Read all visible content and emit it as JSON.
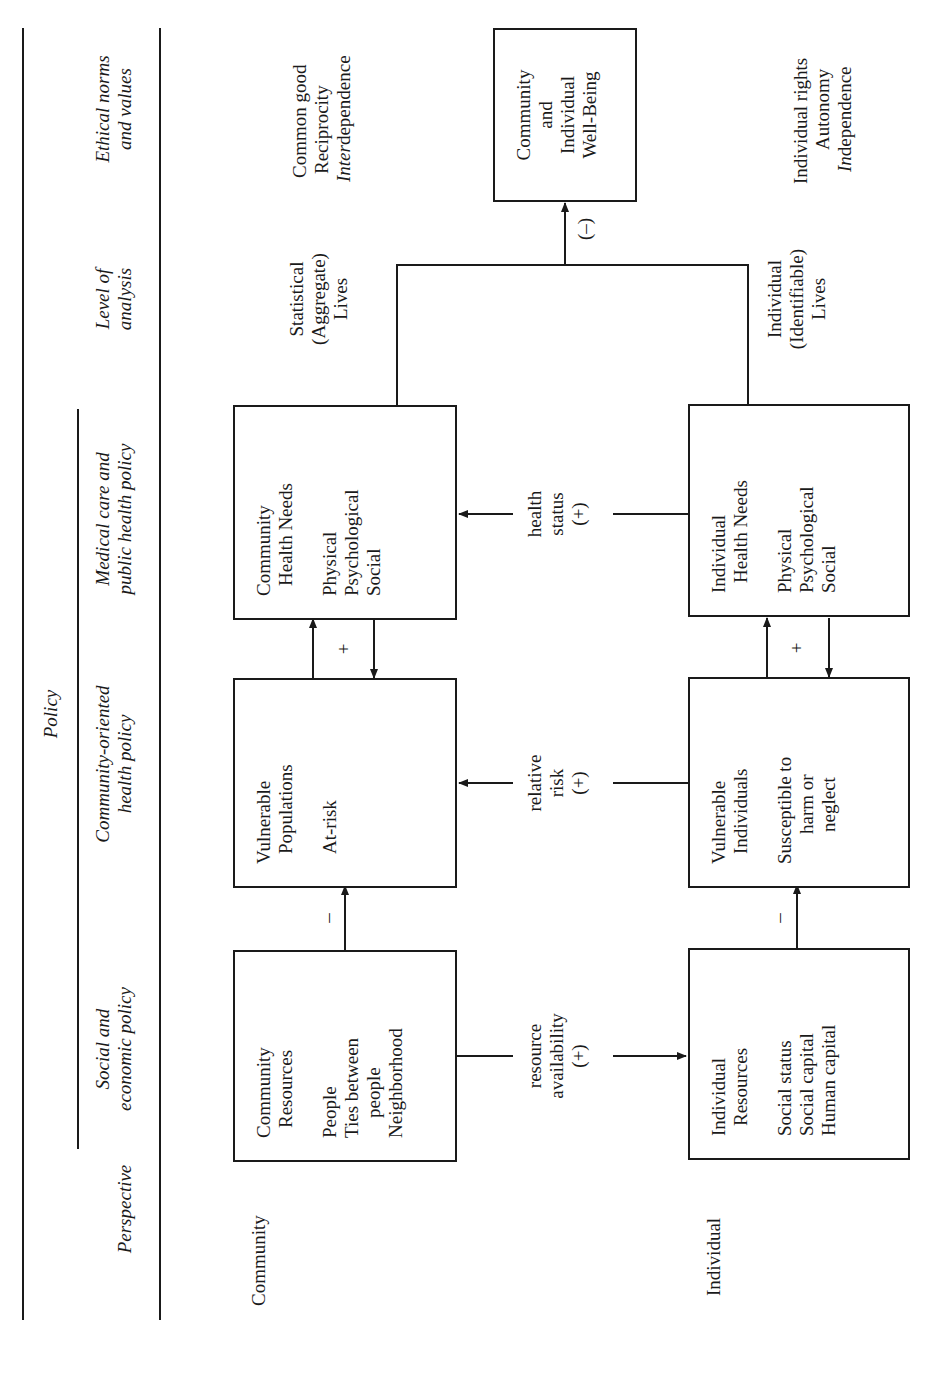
{
  "header": {
    "policy_title": "Policy",
    "columns": [
      {
        "key": "perspective",
        "label_line1": "Perspective",
        "label_line2": ""
      },
      {
        "key": "social_economic",
        "label_line1": "Social and",
        "label_line2": "economic policy"
      },
      {
        "key": "community_oriented",
        "label_line1": "Community-oriented",
        "label_line2": "health policy"
      },
      {
        "key": "medical_public",
        "label_line1": "Medical care and",
        "label_line2": "public health policy"
      },
      {
        "key": "level_analysis",
        "label_line1": "Level of",
        "label_line2": "analysis"
      },
      {
        "key": "ethical",
        "label_line1": "Ethical norms",
        "label_line2": "and values"
      }
    ]
  },
  "rows": {
    "community": {
      "perspective": "Community",
      "resources": {
        "title1": "Community",
        "title2": "Resources",
        "items": [
          "People",
          "Ties between",
          "people",
          "Neighborhood"
        ]
      },
      "vulnerable": {
        "title1": "Vulnerable",
        "title2": "Populations",
        "items": [
          "At-risk"
        ]
      },
      "health_needs": {
        "title1": "Community",
        "title2": "Health Needs",
        "items": [
          "Physical",
          "Psychological",
          "Social"
        ]
      },
      "level": [
        "Statistical",
        "(Aggregate)",
        "Lives"
      ],
      "ethics": {
        "line1": "Common good",
        "line2": "Reciprocity",
        "line3_italic": "Inter",
        "line3_rest": "dependence"
      }
    },
    "individual": {
      "perspective": "Individual",
      "resources": {
        "title1": "Individual",
        "title2": "Resources",
        "items": [
          "Social status",
          "Social capital",
          "Human capital"
        ]
      },
      "vulnerable": {
        "title1": "Vulnerable",
        "title2": "Individuals",
        "items": [
          "Susceptible to",
          "harm or",
          "neglect"
        ]
      },
      "health_needs": {
        "title1": "Individual",
        "title2": "Health Needs",
        "items": [
          "Physical",
          "Psychological",
          "Social"
        ]
      },
      "level": [
        "Individual",
        "(Identifiable)",
        "Lives"
      ],
      "ethics": {
        "line1": "Individual rights",
        "line2": "Autonomy",
        "line3_italic": "In",
        "line3_rest": "dependence"
      }
    }
  },
  "outcome": {
    "line1": "Community",
    "line2": "and",
    "line3": "Individual",
    "line4": "Well-Being"
  },
  "links": {
    "resource_availability": [
      "resource",
      "availability",
      "(+)"
    ],
    "relative_risk": [
      "relative",
      "risk",
      "(+)"
    ],
    "health_status": [
      "health",
      "status",
      "(+)"
    ],
    "resources_to_vulnerable_sign": "–",
    "vulnerable_health_sign": "+",
    "wellbeing_sign": "(–)"
  },
  "colors": {
    "ink": "#1a1a1a",
    "background": "#ffffff"
  }
}
